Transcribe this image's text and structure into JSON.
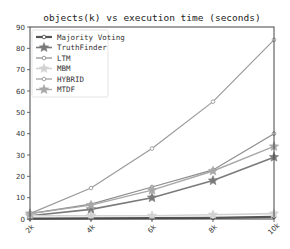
{
  "chart_data": {
    "type": "line",
    "title": "objects(k) vs execution time (seconds)",
    "xlabel": "",
    "ylabel": "",
    "categories": [
      "2k",
      "4k",
      "6k",
      "8k",
      "10k"
    ],
    "ylim": [
      0,
      90
    ],
    "yticks": [
      0,
      10,
      20,
      30,
      40,
      50,
      60,
      70,
      80,
      90
    ],
    "grid": false,
    "legend_position": "upper left",
    "series": [
      {
        "name": "Majority Voting",
        "marker": "circle",
        "color": "#555555",
        "width": 2.2,
        "values": [
          0.2,
          0.3,
          0.4,
          0.5,
          1.0
        ]
      },
      {
        "name": "TruthFinder",
        "marker": "star",
        "color": "#7a7a7a",
        "width": 1.6,
        "values": [
          1.5,
          4.5,
          10,
          18,
          29
        ]
      },
      {
        "name": "LTM",
        "marker": "circle",
        "color": "#8c8c8c",
        "width": 1.2,
        "values": [
          2.5,
          7,
          15,
          23,
          40
        ]
      },
      {
        "name": "MBM",
        "marker": "star",
        "color": "#d2d2d2",
        "width": 1.6,
        "values": [
          1.5,
          1.5,
          1.5,
          2,
          2.5
        ]
      },
      {
        "name": "HYBRID",
        "marker": "circle",
        "color": "#9a9a9a",
        "width": 1.2,
        "values": [
          2.5,
          14.5,
          33,
          55,
          84
        ]
      },
      {
        "name": "MTDF",
        "marker": "star",
        "color": "#a8a8a8",
        "width": 1.4,
        "values": [
          2.5,
          6.5,
          13.5,
          22.5,
          34
        ]
      }
    ]
  }
}
